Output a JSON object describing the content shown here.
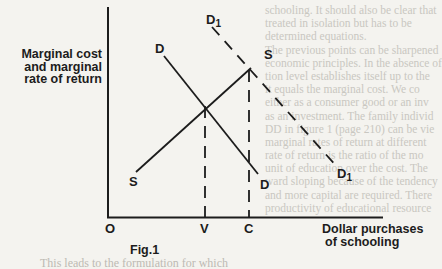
{
  "figure": {
    "caption": "Fig.1",
    "y_axis_label": [
      "Marginal cost",
      "and marginal",
      "rate of return"
    ],
    "x_axis_label": [
      "Dollar purchases",
      "of schooling"
    ],
    "origin_label": "O",
    "x_ticks": [
      "V",
      "C"
    ],
    "curves": [
      {
        "label": "D",
        "style": "solid",
        "description": "demand curve (marginal rate of return)"
      },
      {
        "label": "S",
        "style": "solid",
        "description": "supply curve (marginal cost)"
      },
      {
        "label": "D1",
        "style": "dashed",
        "description": "shifted demand curve"
      }
    ],
    "equilibria": [
      {
        "intersection": "D & S",
        "x_label": "V"
      },
      {
        "intersection": "D1 & S",
        "x_label": "C"
      }
    ],
    "colors": {
      "ink": "#1c1c1c",
      "paper": "#f4f3ef"
    }
  },
  "background_text": {
    "lines": [
      "schooling. It should also be clear that",
      "treated in isolation but has to be",
      "determined equations.",
      "The previous points can be sharpened",
      "economic principles. In the absence of",
      "tion level establishes itself up to the",
      "it equals the marginal cost. We co",
      "either as a consumer good or an inv",
      "as an investment. The family individ",
      "DD in figure 1 (page 210) can be vie",
      "marginal rates of return at different",
      "rate of return is the ratio of the mo",
      "unit of education over the cost. The",
      "ward sloping because of the tendency",
      "and more capital are required. There",
      "productivity of educational resource"
    ],
    "bottom": "This leads to the formulation for which"
  }
}
